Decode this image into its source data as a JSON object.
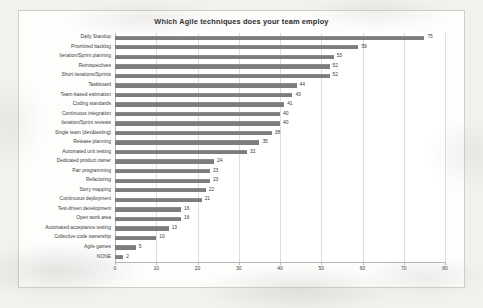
{
  "chart_data": {
    "type": "bar",
    "orientation": "horizontal",
    "title": "Which Agile techniques does your team employ",
    "xlabel": "",
    "ylabel": "",
    "xlim": [
      0,
      80
    ],
    "xticks": [
      0,
      10,
      20,
      30,
      40,
      50,
      60,
      70,
      80
    ],
    "grid": true,
    "gridlines": "vertical",
    "legend": false,
    "bar_color": "#7d7d7d",
    "plot_background": "#ffffff",
    "frame_background": "#fdfdfc",
    "page_background": "#f2f1ee",
    "data_labels": true,
    "categories": [
      "Daily Standup",
      "Prioritized backlog",
      "Iteration/Sprint planning",
      "Retrospectives",
      "Short iterations/Sprints",
      "Taskboard",
      "Team-based estimation",
      "Coding standards",
      "Continuous integration",
      "Iteration/Sprint reviews",
      "Single team (dev&testing)",
      "Release planning",
      "Automated unit testing",
      "Dedicated product owner",
      "Pair programming",
      "Refactoring",
      "Story mapping",
      "Continuous deployment",
      "Test-driven development",
      "Open work area",
      "Automated acceptance testing",
      "Collective code ownership",
      "Agile games",
      "NONE"
    ],
    "values": [
      75,
      59,
      53,
      52,
      52,
      44,
      43,
      41,
      40,
      40,
      38,
      35,
      32,
      24,
      23,
      23,
      22,
      21,
      16,
      16,
      13,
      10,
      5,
      2
    ]
  }
}
